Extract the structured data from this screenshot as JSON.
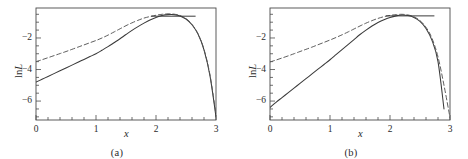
{
  "figure": {
    "panels": [
      {
        "caption": "(a)",
        "xlabel": "x",
        "ylabel_prefix": "ln",
        "ylabel_var": "L",
        "xticks": [
          0,
          1,
          2,
          3
        ],
        "xtick_labels": [
          "0",
          "1",
          "2",
          "3"
        ],
        "yticks": [
          -2,
          -4,
          -6
        ],
        "ytick_labels": [
          "−2",
          "−4",
          "−6"
        ],
        "xlim": [
          0,
          3
        ],
        "ylim": [
          -7.2,
          -0.1
        ],
        "minor_x_step": 0.2,
        "minor_y_step": 0.5,
        "ci_line": {
          "y": -0.62,
          "x_start": 1.92,
          "x_end": 2.66
        }
      },
      {
        "caption": "(b)",
        "xlabel": "x",
        "ylabel_prefix": "ln",
        "ylabel_var": "L",
        "xticks": [
          0,
          1,
          2,
          3
        ],
        "xtick_labels": [
          "0",
          "1",
          "2",
          "3"
        ],
        "yticks": [
          -2,
          -4,
          -6
        ],
        "ytick_labels": [
          "−2",
          "−4",
          "−6"
        ],
        "xlim": [
          0,
          3
        ],
        "ylim": [
          -7.2,
          -0.1
        ],
        "minor_x_step": 0.2,
        "minor_y_step": 0.5,
        "ci_line": {
          "y": -0.6,
          "x_start": 1.93,
          "x_end": 2.74
        }
      }
    ]
  },
  "colors": {
    "axis": "#4a4a4a",
    "solid_curve": "#3a3a3a",
    "dashed_curve": "#555555",
    "text": "#2b2b2b",
    "background": "#ffffff"
  },
  "chart_data": [
    {
      "type": "line",
      "title": "",
      "subtitle": "",
      "panel": "(a)",
      "xlabel": "x",
      "ylabel": "ln L",
      "xlim": [
        0,
        3
      ],
      "ylim": [
        -7.2,
        -0.1
      ],
      "xticks": [
        0,
        1,
        2,
        3
      ],
      "yticks": [
        -2,
        -4,
        -6
      ],
      "grid": false,
      "legend": "none",
      "annotations": [
        {
          "kind": "horizontal-segment",
          "label": "confidence-interval-line",
          "y": -0.62,
          "x_start": 1.92,
          "x_end": 2.66
        }
      ],
      "x": [
        0,
        0.1,
        0.2,
        0.3,
        0.4,
        0.5,
        0.6,
        0.7,
        0.8,
        0.9,
        1.0,
        1.1,
        1.2,
        1.3,
        1.4,
        1.5,
        1.6,
        1.7,
        1.8,
        1.9,
        2.0,
        2.1,
        2.2,
        2.3,
        2.4,
        2.5,
        2.6,
        2.7,
        2.8,
        2.9,
        3.0
      ],
      "series": [
        {
          "name": "exact log-likelihood (solid)",
          "style": "solid",
          "values": [
            -4.8,
            -4.62,
            -4.44,
            -4.26,
            -4.08,
            -3.9,
            -3.72,
            -3.54,
            -3.36,
            -3.18,
            -3.0,
            -2.78,
            -2.55,
            -2.3,
            -2.05,
            -1.78,
            -1.52,
            -1.28,
            -1.06,
            -0.86,
            -0.7,
            -0.58,
            -0.52,
            -0.52,
            -0.6,
            -0.8,
            -1.16,
            -1.75,
            -2.75,
            -4.4,
            -7.0
          ]
        },
        {
          "name": "approximation (dashed)",
          "style": "dashed",
          "values": [
            -3.5,
            -3.38,
            -3.25,
            -3.12,
            -2.99,
            -2.86,
            -2.72,
            -2.58,
            -2.44,
            -2.3,
            -2.16,
            -2.0,
            -1.82,
            -1.62,
            -1.42,
            -1.22,
            -1.04,
            -0.88,
            -0.74,
            -0.64,
            -0.56,
            -0.5,
            -0.47,
            -0.49,
            -0.58,
            -0.78,
            -1.14,
            -1.74,
            -2.72,
            -4.35,
            -6.85
          ]
        }
      ]
    },
    {
      "type": "line",
      "title": "",
      "subtitle": "",
      "panel": "(b)",
      "xlabel": "x",
      "ylabel": "ln L",
      "xlim": [
        0,
        3
      ],
      "ylim": [
        -7.2,
        -0.1
      ],
      "xticks": [
        0,
        1,
        2,
        3
      ],
      "yticks": [
        -2,
        -4,
        -6
      ],
      "grid": false,
      "legend": "none",
      "annotations": [
        {
          "kind": "horizontal-segment",
          "label": "confidence-interval-line",
          "y": -0.6,
          "x_start": 1.93,
          "x_end": 2.74
        }
      ],
      "x": [
        0,
        0.1,
        0.2,
        0.3,
        0.4,
        0.5,
        0.6,
        0.7,
        0.8,
        0.9,
        1.0,
        1.1,
        1.2,
        1.3,
        1.4,
        1.5,
        1.6,
        1.7,
        1.8,
        1.9,
        2.0,
        2.1,
        2.2,
        2.3,
        2.4,
        2.5,
        2.6,
        2.7,
        2.8,
        2.9,
        3.0
      ],
      "series": [
        {
          "name": "exact log-likelihood (solid)",
          "style": "solid",
          "values": [
            -6.4,
            -6.08,
            -5.78,
            -5.48,
            -5.18,
            -4.88,
            -4.58,
            -4.28,
            -3.98,
            -3.68,
            -3.38,
            -3.06,
            -2.74,
            -2.42,
            -2.1,
            -1.78,
            -1.5,
            -1.24,
            -1.02,
            -0.84,
            -0.7,
            -0.6,
            -0.55,
            -0.58,
            -0.7,
            -0.95,
            -1.4,
            -2.15,
            -3.5,
            -6.5,
            null
          ]
        },
        {
          "name": "approximation (dashed)",
          "style": "dashed",
          "values": [
            -3.52,
            -3.4,
            -3.27,
            -3.14,
            -3.0,
            -2.86,
            -2.72,
            -2.58,
            -2.43,
            -2.28,
            -2.13,
            -1.97,
            -1.8,
            -1.62,
            -1.43,
            -1.24,
            -1.06,
            -0.9,
            -0.76,
            -0.65,
            -0.57,
            -0.52,
            -0.5,
            -0.54,
            -0.66,
            -0.9,
            -1.32,
            -2.02,
            -3.2,
            -5.0,
            -7.05
          ]
        }
      ]
    }
  ]
}
